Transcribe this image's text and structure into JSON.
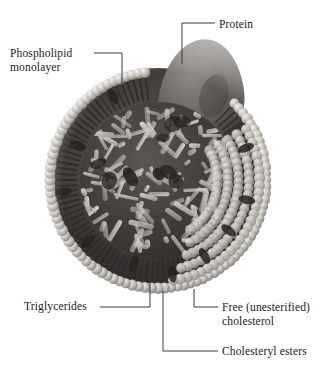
{
  "figure": {
    "palette": {
      "background": "#ffffff",
      "text": "#1a1a1a",
      "leader_line": "#3a3a3a",
      "head_group_light": "#d8d5d0",
      "head_group_mid": "#a8a49e",
      "tail_dark": "#2e2c2a",
      "core_dark": "#3c3a38",
      "core_rod_light": "#cfccc7",
      "protein_gray": "#6e6a66",
      "cholesterol_dark": "#26241f"
    }
  },
  "labels": {
    "phospholipid": "Phospholipid\nmonolayer",
    "protein": "Protein",
    "triglycerides": "Triglycerides",
    "free_cholesterol": "Free (unesterified)\ncholesterol",
    "cholesteryl_esters": "Cholesteryl esters"
  },
  "structure": {
    "center_x": 158,
    "center_y": 180,
    "radius": 112,
    "protein_bulge": {
      "cx": 196,
      "cy": 72,
      "rx": 40,
      "ry": 34
    },
    "monolayer": {
      "head_count": 104,
      "head_radius": 5.4,
      "tail_length": 26,
      "tail_count": 104
    },
    "core": {
      "rod_count": 120,
      "cholesterol_blob_count": 9
    }
  },
  "leaders": [
    {
      "name": "phospholipid",
      "points": "94,53 122,53 122,101"
    },
    {
      "name": "protein",
      "points": "215,23 182,23 182,64"
    },
    {
      "name": "triglycerides",
      "points": "100,307 150,307 150,268"
    },
    {
      "name": "free-cholesterol",
      "points": "218,307 194,307 194,289"
    },
    {
      "name": "cholesteryl-esters",
      "points": "218,351 163,351 163,291"
    }
  ]
}
